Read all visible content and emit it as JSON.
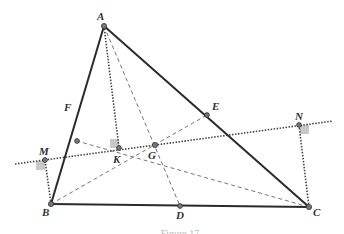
{
  "figure": {
    "caption": "Figure 17",
    "colors": {
      "triangle": "#2a2a2a",
      "dashed": "#777777",
      "dotted": "#444444",
      "point_fill": "#666666",
      "right_angle": "#c8c8c8"
    },
    "points": {
      "A": {
        "label": "A",
        "x": 104,
        "y": 26
      },
      "B": {
        "label": "B",
        "x": 51,
        "y": 204
      },
      "C": {
        "label": "C",
        "x": 309,
        "y": 207
      },
      "D": {
        "label": "D",
        "x": 180,
        "y": 206
      },
      "E": {
        "label": "E",
        "x": 207,
        "y": 115
      },
      "F": {
        "label": "F",
        "x": 77,
        "y": 141
      },
      "G": {
        "label": "G",
        "x": 155,
        "y": 145
      },
      "K": {
        "label": "K",
        "x": 119,
        "y": 148
      },
      "M": {
        "label": "M",
        "x": 45,
        "y": 160
      },
      "N": {
        "label": "N",
        "x": 299,
        "y": 125
      }
    },
    "segments": {
      "solid": [
        "AB",
        "BC",
        "CA"
      ],
      "dashed_medians": [
        "AD",
        "BE",
        "CF"
      ],
      "dotted_perpendiculars": [
        "AK",
        "BM",
        "CN"
      ],
      "dotted_line": "MN through G"
    }
  }
}
